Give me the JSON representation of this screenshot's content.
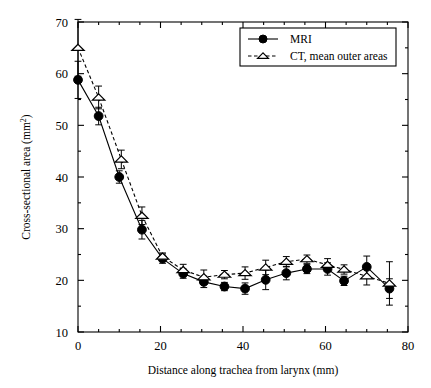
{
  "figure": {
    "background": "#ffffff",
    "foreground": "#000000"
  },
  "chart_data": {
    "type": "line",
    "title": "",
    "xlabel": "Distance along trachea from larynx (mm)",
    "ylabel_prefix": "Cross-sectional area (mm",
    "ylabel_sup": "2",
    "ylabel_suffix": ")",
    "xlim": [
      0,
      80
    ],
    "ylim": [
      10,
      70
    ],
    "xticks": [
      0,
      20,
      40,
      60,
      80
    ],
    "xticklabels": [
      "0",
      "20",
      "40",
      "60",
      "80"
    ],
    "xminor_step": 5,
    "yticks": [
      10,
      20,
      30,
      40,
      50,
      60,
      70
    ],
    "yticklabels": [
      "10",
      "20",
      "30",
      "40",
      "50",
      "60",
      "70"
    ],
    "yminor_step": 5,
    "grid": false,
    "legend_position": "top-right",
    "series": [
      {
        "name": "MRI",
        "marker": "filled-circle",
        "linestyle": "solid",
        "x": [
          0,
          5,
          10,
          15.5,
          20.5,
          25.5,
          30.5,
          35.5,
          40.5,
          45.5,
          50.5,
          55.5,
          60.5,
          64.5,
          70,
          75.5
        ],
        "values": [
          58.8,
          51.8,
          40.0,
          29.8,
          24.2,
          21.3,
          19.7,
          18.8,
          18.4,
          20.1,
          21.4,
          22.2,
          22.2,
          19.9,
          22.6,
          18.4
        ],
        "errors": [
          3.6,
          1.7,
          1.2,
          1.8,
          0.9,
          0.9,
          1.1,
          0.8,
          1.1,
          1.9,
          1.3,
          0.9,
          1.2,
          0.9,
          2.1,
          1.9
        ]
      },
      {
        "name": "CT, mean outer areas",
        "marker": "open-triangle",
        "linestyle": "dashed",
        "x": [
          0,
          5,
          10.5,
          15.5,
          20.5,
          25.5,
          30.5,
          35.5,
          40.5,
          45.5,
          50.5,
          55.5,
          60.5,
          64.5,
          70,
          75.5
        ],
        "values": [
          65.0,
          55.4,
          43.4,
          32.5,
          24.6,
          22.0,
          20.6,
          21.1,
          21.4,
          22.5,
          23.6,
          24.1,
          23.0,
          22.1,
          20.8,
          19.4
        ],
        "errors": [
          5.5,
          2.2,
          1.8,
          1.7,
          0.7,
          1.1,
          1.4,
          0.8,
          1.2,
          1.4,
          1.0,
          0.8,
          1.2,
          0.9,
          1.7,
          4.2
        ]
      }
    ]
  },
  "legend": {
    "entries": [
      {
        "label": "MRI",
        "marker": "filled-circle",
        "linestyle": "solid"
      },
      {
        "label": "CT, mean outer areas",
        "marker": "open-triangle",
        "linestyle": "dashed"
      }
    ]
  }
}
